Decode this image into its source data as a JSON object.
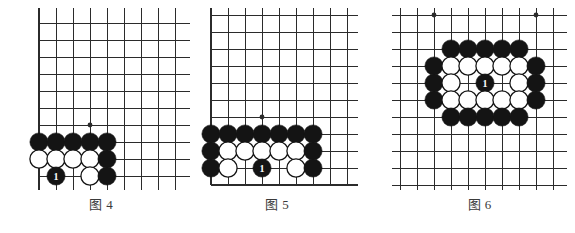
{
  "page": {
    "width": 575,
    "height": 233,
    "background": "#ffffff",
    "content_type": "go-problem-diagrams",
    "line_color": "#2b2b2b",
    "black_stone_color": "#141414",
    "white_stone_color": "#ffffff",
    "white_stone_border": "#141414",
    "marker_text_color": "#ffffff"
  },
  "figures": [
    {
      "id": "fig4",
      "caption_label": "图",
      "caption_number": "4",
      "caption_text": "图 4",
      "left": 12,
      "top": 8,
      "board": {
        "origin_x": 27,
        "origin_y": 15,
        "spacing": 17,
        "cols": 10,
        "rows": 11,
        "clip_width": 178,
        "clip_height": 182,
        "edges": {
          "left": true,
          "bottom": true,
          "top": false,
          "right": false
        },
        "star_points": [
          {
            "col": 3,
            "row": 6
          }
        ],
        "stones": [
          {
            "col": 0,
            "row": 7,
            "color": "black"
          },
          {
            "col": 1,
            "row": 7,
            "color": "black"
          },
          {
            "col": 2,
            "row": 7,
            "color": "black"
          },
          {
            "col": 3,
            "row": 7,
            "color": "black"
          },
          {
            "col": 4,
            "row": 7,
            "color": "black"
          },
          {
            "col": 0,
            "row": 8,
            "color": "white"
          },
          {
            "col": 1,
            "row": 8,
            "color": "white"
          },
          {
            "col": 2,
            "row": 8,
            "color": "white"
          },
          {
            "col": 3,
            "row": 8,
            "color": "white"
          },
          {
            "col": 4,
            "row": 8,
            "color": "black"
          },
          {
            "col": 1,
            "row": 9,
            "color": "black",
            "marker": "1"
          },
          {
            "col": 3,
            "row": 9,
            "color": "white"
          },
          {
            "col": 4,
            "row": 9,
            "color": "black"
          }
        ]
      }
    },
    {
      "id": "fig5",
      "caption_label": "图",
      "caption_number": "5",
      "caption_text": "图 5",
      "left": 196,
      "top": 8,
      "board": {
        "origin_x": 15,
        "origin_y": 7,
        "spacing": 17,
        "cols": 9,
        "rows": 11,
        "clip_width": 162,
        "clip_height": 182,
        "edges": {
          "left": true,
          "bottom": true,
          "top": false,
          "right": false
        },
        "star_points": [
          {
            "col": 3,
            "row": 6
          }
        ],
        "stones": [
          {
            "col": 0,
            "row": 7,
            "color": "black"
          },
          {
            "col": 1,
            "row": 7,
            "color": "black"
          },
          {
            "col": 2,
            "row": 7,
            "color": "black"
          },
          {
            "col": 3,
            "row": 7,
            "color": "black"
          },
          {
            "col": 4,
            "row": 7,
            "color": "black"
          },
          {
            "col": 5,
            "row": 7,
            "color": "black"
          },
          {
            "col": 6,
            "row": 7,
            "color": "black"
          },
          {
            "col": 0,
            "row": 8,
            "color": "black"
          },
          {
            "col": 1,
            "row": 8,
            "color": "white"
          },
          {
            "col": 2,
            "row": 8,
            "color": "white"
          },
          {
            "col": 3,
            "row": 8,
            "color": "white"
          },
          {
            "col": 4,
            "row": 8,
            "color": "white"
          },
          {
            "col": 5,
            "row": 8,
            "color": "white"
          },
          {
            "col": 6,
            "row": 8,
            "color": "black"
          },
          {
            "col": 0,
            "row": 9,
            "color": "black"
          },
          {
            "col": 1,
            "row": 9,
            "color": "white"
          },
          {
            "col": 3,
            "row": 9,
            "color": "black",
            "marker": "1"
          },
          {
            "col": 5,
            "row": 9,
            "color": "white"
          },
          {
            "col": 6,
            "row": 9,
            "color": "black"
          }
        ]
      }
    },
    {
      "id": "fig6",
      "caption_label": "图",
      "caption_number": "6",
      "caption_text": "图 6",
      "left": 392,
      "top": 8,
      "board": {
        "origin_x": 8,
        "origin_y": 7,
        "spacing": 17,
        "cols": 10,
        "rows": 11,
        "clip_width": 175,
        "clip_height": 182,
        "edges": {
          "left": false,
          "bottom": false,
          "top": false,
          "right": false
        },
        "star_points": [
          {
            "col": 2,
            "row": 0
          },
          {
            "col": 8,
            "row": 0
          },
          {
            "col": 8,
            "row": 5
          }
        ],
        "stones": [
          {
            "col": 3,
            "row": 2,
            "color": "black"
          },
          {
            "col": 4,
            "row": 2,
            "color": "black"
          },
          {
            "col": 5,
            "row": 2,
            "color": "black"
          },
          {
            "col": 6,
            "row": 2,
            "color": "black"
          },
          {
            "col": 7,
            "row": 2,
            "color": "black"
          },
          {
            "col": 2,
            "row": 3,
            "color": "black"
          },
          {
            "col": 3,
            "row": 3,
            "color": "white"
          },
          {
            "col": 4,
            "row": 3,
            "color": "white"
          },
          {
            "col": 5,
            "row": 3,
            "color": "white"
          },
          {
            "col": 6,
            "row": 3,
            "color": "white"
          },
          {
            "col": 7,
            "row": 3,
            "color": "white"
          },
          {
            "col": 8,
            "row": 3,
            "color": "black"
          },
          {
            "col": 2,
            "row": 4,
            "color": "black"
          },
          {
            "col": 3,
            "row": 4,
            "color": "white"
          },
          {
            "col": 5,
            "row": 4,
            "color": "black",
            "marker": "1"
          },
          {
            "col": 7,
            "row": 4,
            "color": "white"
          },
          {
            "col": 8,
            "row": 4,
            "color": "black"
          },
          {
            "col": 2,
            "row": 5,
            "color": "black"
          },
          {
            "col": 3,
            "row": 5,
            "color": "white"
          },
          {
            "col": 4,
            "row": 5,
            "color": "white"
          },
          {
            "col": 5,
            "row": 5,
            "color": "white"
          },
          {
            "col": 6,
            "row": 5,
            "color": "white"
          },
          {
            "col": 7,
            "row": 5,
            "color": "white"
          },
          {
            "col": 8,
            "row": 5,
            "color": "black"
          },
          {
            "col": 3,
            "row": 6,
            "color": "black"
          },
          {
            "col": 4,
            "row": 6,
            "color": "black"
          },
          {
            "col": 5,
            "row": 6,
            "color": "black"
          },
          {
            "col": 6,
            "row": 6,
            "color": "black"
          },
          {
            "col": 7,
            "row": 6,
            "color": "black"
          }
        ]
      }
    }
  ]
}
